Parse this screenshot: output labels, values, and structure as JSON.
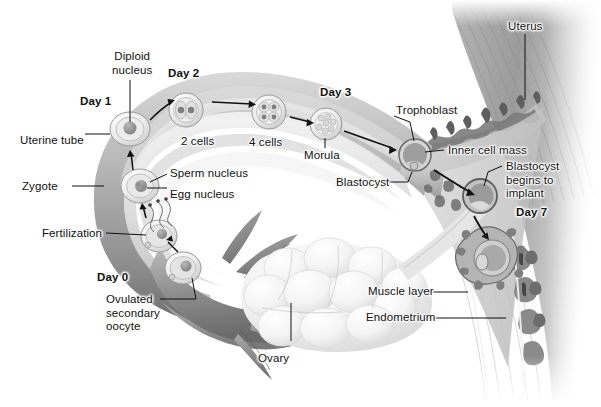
{
  "figure": {
    "style": "grayscale medical illustration",
    "background_color": "#ffffff",
    "ink_color": "#111111"
  },
  "labels": {
    "diploid_nucleus": "Diploid\nnucleus",
    "day2": "Day 2",
    "day1": "Day 1",
    "day3": "Day 3",
    "day0": "Day 0",
    "day7": "Day 7",
    "uterine_tube": "Uterine tube",
    "zygote": "Zygote",
    "fertilization": "Fertilization",
    "sperm_nucleus": "Sperm nucleus",
    "egg_nucleus": "Egg nucleus",
    "two_cells": "2 cells",
    "four_cells": "4 cells",
    "morula": "Morula",
    "blastocyst": "Blastocyst",
    "trophoblast": "Trophoblast",
    "inner_cell_mass": "Inner cell mass",
    "blastocyst_implants": "Blastocyst\nbegins to\nimplant",
    "uterus": "Uterus",
    "ovary": "Ovary",
    "ovulated_oocyte": "Ovulated\nsecondary\noocyte",
    "muscle_layer": "Muscle layer",
    "endometrium": "Endometrium"
  },
  "structures": [
    {
      "name": "ovary",
      "label": "Ovary"
    },
    {
      "name": "uterine-tube",
      "label": "Uterine tube"
    },
    {
      "name": "uterus",
      "label": "Uterus"
    },
    {
      "name": "endometrium",
      "label": "Endometrium"
    },
    {
      "name": "muscle-layer",
      "label": "Muscle layer"
    }
  ],
  "developmental_stages": [
    {
      "day": "Day 0",
      "stage": "Ovulated secondary oocyte"
    },
    {
      "day": "Day 0",
      "stage": "Fertilization"
    },
    {
      "day": "Day 1",
      "stage": "Zygote"
    },
    {
      "day": "Day 1",
      "stage": "Diploid nucleus"
    },
    {
      "day": "Day 2",
      "stage": "2 cells"
    },
    {
      "day": "Day 2",
      "stage": "4 cells"
    },
    {
      "day": "Day 3",
      "stage": "Morula"
    },
    {
      "day": "Day 3",
      "stage": "Blastocyst"
    },
    {
      "day": "Day 7",
      "stage": "Blastocyst begins to implant"
    }
  ]
}
